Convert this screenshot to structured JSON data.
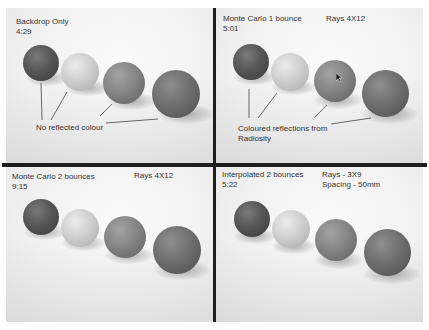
{
  "panels": [
    {
      "id": "backdrop-only",
      "title": "Backdrop Only",
      "time": "4:29",
      "settings": [],
      "annotation": "No reflected colour"
    },
    {
      "id": "monte-carlo-1",
      "title": "Monte Carlo 1 bounce",
      "time": "5:01",
      "settings": [
        "Rays 4X12"
      ],
      "annotation": "Coloured reflections from\nRadiosity"
    },
    {
      "id": "monte-carlo-2",
      "title": "Monte Carlo 2 bounces",
      "time": "9:15",
      "settings": [
        "Rays 4X12"
      ],
      "annotation": ""
    },
    {
      "id": "interpolated-2",
      "title": "Interpolated 2 bounces",
      "time": "5:22",
      "settings": [
        "Rays - 3X9",
        "Spacing - 50mm"
      ],
      "annotation": ""
    }
  ],
  "spheres": [
    "dark",
    "light",
    "mid",
    "mid-dark"
  ],
  "colors": {
    "divider": "#1e1e1e",
    "background": "#f1f1f1",
    "text": "#333333"
  }
}
